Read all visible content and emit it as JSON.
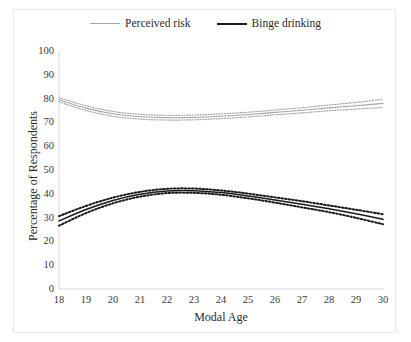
{
  "chart_data": {
    "type": "line",
    "title": "",
    "xlabel": "Modal Age",
    "ylabel": "Percentage of Respondents",
    "xlim": [
      18,
      30
    ],
    "ylim": [
      0,
      100
    ],
    "grid": false,
    "legend_position": "top-center",
    "x": [
      18,
      19,
      20,
      21,
      22,
      23,
      24,
      25,
      26,
      27,
      28,
      29,
      30
    ],
    "xticks": [
      "18",
      "19",
      "20",
      "21",
      "22",
      "23",
      "24",
      "25",
      "26",
      "27",
      "28",
      "29",
      "30"
    ],
    "yticks": [
      "0",
      "10",
      "20",
      "30",
      "40",
      "50",
      "60",
      "70",
      "80",
      "90",
      "100"
    ],
    "series": [
      {
        "name": "Perceived risk",
        "color": "#a6a6a6",
        "style": "solid-with-dotted-confidence-band",
        "values": [
          79.5,
          76.0,
          73.6,
          72.4,
          72.0,
          72.1,
          72.6,
          73.3,
          74.2,
          75.1,
          76.1,
          77.0,
          78.0
        ],
        "ci_upper": [
          80.4,
          77.0,
          74.6,
          73.4,
          73.0,
          73.1,
          73.6,
          74.3,
          75.2,
          76.2,
          77.3,
          78.4,
          79.7
        ],
        "ci_lower": [
          78.6,
          75.0,
          72.6,
          71.4,
          71.0,
          71.1,
          71.6,
          72.3,
          73.2,
          74.0,
          74.9,
          75.6,
          76.3
        ]
      },
      {
        "name": "Binge drinking",
        "color": "#1a1a1a",
        "style": "solid-with-dotted-confidence-band",
        "values": [
          28.6,
          33.4,
          37.2,
          39.8,
          41.2,
          41.3,
          40.5,
          39.1,
          37.4,
          35.6,
          33.7,
          31.6,
          29.3
        ],
        "ci_upper": [
          30.6,
          34.9,
          38.4,
          40.8,
          42.1,
          42.2,
          41.4,
          40.1,
          38.5,
          36.9,
          35.1,
          33.3,
          31.4
        ],
        "ci_lower": [
          26.6,
          31.9,
          36.0,
          38.8,
          40.3,
          40.4,
          39.6,
          38.1,
          36.3,
          34.3,
          32.3,
          29.9,
          27.2
        ]
      }
    ]
  },
  "legend": {
    "items": [
      {
        "label": "Perceived risk",
        "color": "#a6a6a6",
        "width": "1.3px"
      },
      {
        "label": "Binge drinking",
        "color": "#1a1a1a",
        "width": "2.4px"
      }
    ]
  },
  "axes": {
    "x_title": "Modal Age",
    "y_title": "Percentage of Respondents"
  }
}
